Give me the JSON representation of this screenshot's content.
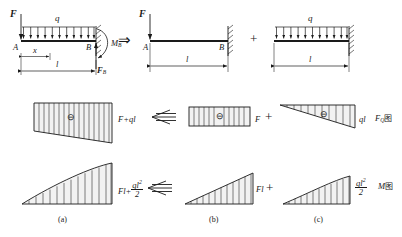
{
  "figure": {
    "title_caption_row": [
      "(a)",
      "(b)",
      "(c)"
    ],
    "row1": {
      "left_beam": {
        "point_load_label": "F",
        "distributed_load_label": "q",
        "node_left": "A",
        "node_right": "B",
        "reaction_moment": "M",
        "reaction_moment_sub": "B",
        "reaction_force": "F",
        "reaction_force_sub": "B",
        "dim_partial": "x",
        "dim_full": "l",
        "udl_arrow_count": 11
      },
      "implies_arrow": "⇒",
      "middle_beam": {
        "point_load_label": "F",
        "node_left": "A",
        "node_right": "B",
        "dim_full": "l"
      },
      "plus_sign": "+",
      "right_beam": {
        "distributed_load_label": "q",
        "dim_full": "l",
        "udl_arrow_count": 11
      }
    },
    "row2": {
      "combined": {
        "sign_marker": "⊖",
        "value_label": "F+ql",
        "shape": "trapezoid",
        "hatch_count": 15
      },
      "equals_arrow": "⇐",
      "from_force": {
        "sign_marker": "⊖",
        "value_label": "F",
        "shape": "rectangle",
        "hatch_count": 11
      },
      "plus_sign": "+",
      "from_udl": {
        "sign_marker": "⊖",
        "value_label": "ql",
        "shape": "triangle",
        "hatch_count": 10
      },
      "diagram_name": "F",
      "diagram_name_sub": "Q",
      "diagram_name_cjk": "图"
    },
    "row3": {
      "combined": {
        "value_prefix": "Fl+",
        "value_frac_num": "ql",
        "value_frac_num_sup": "2",
        "value_frac_den": "2",
        "shape": "parabola",
        "hatch_count": 13
      },
      "equals_arrow": "⇐",
      "from_force": {
        "value_label": "Fl",
        "shape": "triangle",
        "hatch_count": 11
      },
      "plus_sign": "+",
      "from_udl": {
        "value_frac_num": "ql",
        "value_frac_num_sup": "2",
        "value_frac_den": "2",
        "shape": "parabola",
        "hatch_count": 10
      },
      "diagram_name": "M",
      "diagram_name_cjk": "图"
    }
  },
  "colors": {
    "ink": "#1a1a1a",
    "fill": "#f2f2f2"
  }
}
